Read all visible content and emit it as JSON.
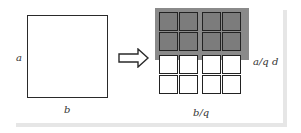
{
  "diagram": {
    "left_square": {
      "side_label": "a",
      "bottom_label": "b"
    },
    "arrow": {
      "direction": "right",
      "icon": "hollow-right-arrow"
    },
    "grid": {
      "rows": 4,
      "cols": 4,
      "group_size": 2,
      "shaded_rows": [
        0,
        1
      ],
      "shade_color": "#8a8a8a",
      "cell_shade_color": "#7c7c7c"
    },
    "right_label": "a/q d",
    "bottom_label": "b/q",
    "frame_shadow_color": "#e6e6e6"
  }
}
